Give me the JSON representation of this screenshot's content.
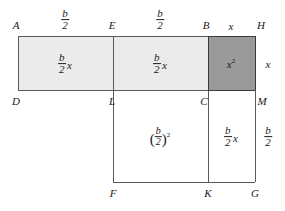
{
  "figure": {
    "kind": "geometric-completing-the-square-diagram",
    "canvas": {
      "width": 285,
      "height": 211
    },
    "colors": {
      "stroke": "#5a5a5a",
      "stroke_dark": "#3a3a3a",
      "fill_light": "#ebebeb",
      "fill_dark": "#9a9a9a",
      "background": "#ffffff",
      "text": "#1a1a1a"
    },
    "geometry": {
      "left": 18,
      "divider_el": 113,
      "divider_bc": 208,
      "right": 255,
      "top": 36,
      "middle": 90,
      "bottom": 182
    }
  },
  "vertices": [
    {
      "id": "A",
      "label": "A",
      "x": 16,
      "y": 25
    },
    {
      "id": "E",
      "label": "E",
      "x": 112,
      "y": 25
    },
    {
      "id": "B",
      "label": "B",
      "x": 206,
      "y": 25
    },
    {
      "id": "H",
      "label": "H",
      "x": 261,
      "y": 25
    },
    {
      "id": "D",
      "label": "D",
      "x": 16,
      "y": 101
    },
    {
      "id": "L",
      "label": "L",
      "x": 112,
      "y": 101
    },
    {
      "id": "C",
      "label": "C",
      "x": 204,
      "y": 101
    },
    {
      "id": "M",
      "label": "M",
      "x": 262,
      "y": 101
    },
    {
      "id": "F",
      "label": "F",
      "x": 113,
      "y": 193
    },
    {
      "id": "K",
      "label": "K",
      "x": 208,
      "y": 193
    },
    {
      "id": "G",
      "label": "G",
      "x": 255,
      "y": 193
    }
  ],
  "dimensions": [
    {
      "id": "top-ae",
      "type": "fraction",
      "numerator": "b",
      "denominator": "2",
      "x": 65,
      "y": 20,
      "edge": "A-E"
    },
    {
      "id": "top-eb",
      "type": "fraction",
      "numerator": "b",
      "denominator": "2",
      "x": 160,
      "y": 20,
      "edge": "E-B"
    },
    {
      "id": "top-bh",
      "type": "plain",
      "text": "x",
      "x": 231,
      "y": 26,
      "edge": "B-H"
    },
    {
      "id": "right-hm",
      "type": "plain",
      "text": "x",
      "x": 268,
      "y": 64,
      "edge": "H-M"
    },
    {
      "id": "right-mg",
      "type": "fraction",
      "numerator": "b",
      "denominator": "2",
      "x": 268,
      "y": 137,
      "edge": "M-G"
    }
  ],
  "regions": [
    {
      "id": "ADLE",
      "name": "top-left-rectangle",
      "fill": "light",
      "rect": {
        "x": 18,
        "y": 36,
        "w": 95,
        "h": 54
      },
      "area_label": {
        "type": "fraction-times-x",
        "numerator": "b",
        "denominator": "2",
        "factor": "x",
        "x": 65,
        "y": 64
      }
    },
    {
      "id": "ELCB",
      "name": "top-middle-rectangle",
      "fill": "light",
      "rect": {
        "x": 113,
        "y": 36,
        "w": 95,
        "h": 54
      },
      "area_label": {
        "type": "fraction-times-x",
        "numerator": "b",
        "denominator": "2",
        "factor": "x",
        "x": 160,
        "y": 64
      }
    },
    {
      "id": "BHMC",
      "name": "top-right-square",
      "fill": "dark",
      "rect": {
        "x": 208,
        "y": 36,
        "w": 47,
        "h": 54
      },
      "area_label": {
        "type": "power",
        "base": "x",
        "exponent": "2",
        "x": 231,
        "y": 64
      }
    },
    {
      "id": "LFKC",
      "name": "bottom-left-square",
      "fill": "none",
      "rect": {
        "x": 113,
        "y": 90,
        "w": 95,
        "h": 92
      },
      "area_label": {
        "type": "fraction-power",
        "numerator": "b",
        "denominator": "2",
        "exponent": "2",
        "x": 160,
        "y": 137
      }
    },
    {
      "id": "CKGM",
      "name": "bottom-right-rectangle",
      "fill": "none",
      "rect": {
        "x": 208,
        "y": 90,
        "w": 47,
        "h": 92
      },
      "area_label": {
        "type": "fraction-times-x",
        "numerator": "b",
        "denominator": "2",
        "factor": "x",
        "x": 231,
        "y": 137
      }
    }
  ]
}
